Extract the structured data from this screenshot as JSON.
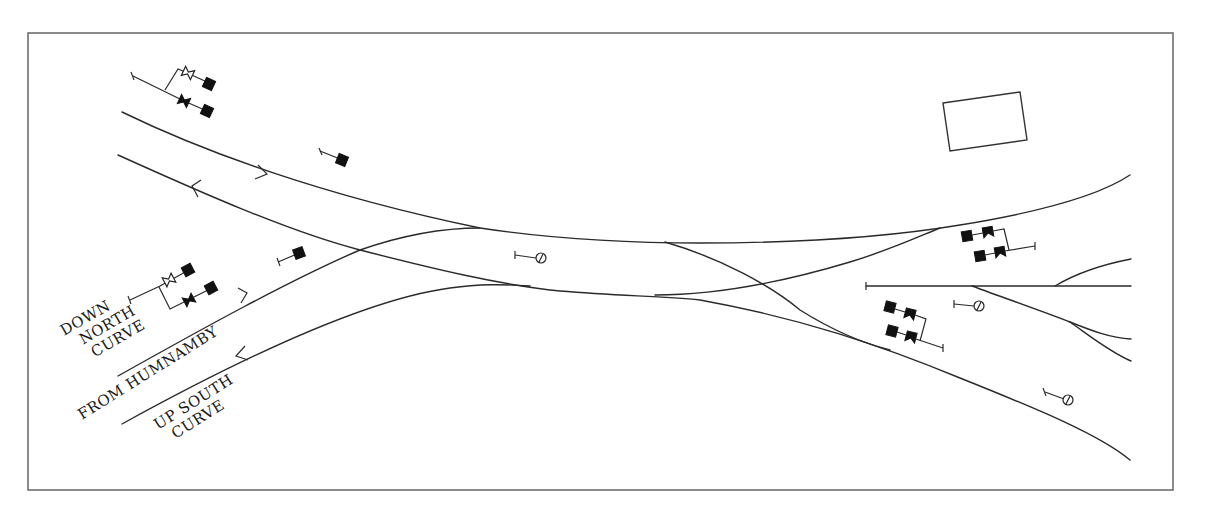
{
  "diagram": {
    "type": "railway-track-layout",
    "frame": {
      "x": 28,
      "y": 33,
      "width": 1145,
      "height": 457,
      "color": "#6e6e6e"
    },
    "labels": {
      "down_north_curve": [
        "DOWN",
        "NORTH",
        "CURVE"
      ],
      "from_humnamby": "FROM HUMNAMBY",
      "up_south_curve": [
        "UP SOUTH",
        "CURVE"
      ]
    },
    "tracks": [
      {
        "id": "down-main",
        "direction": "right"
      },
      {
        "id": "up-main",
        "direction": "left"
      },
      {
        "id": "from-humnamby",
        "direction": "right"
      },
      {
        "id": "up-south-curve",
        "direction": "left"
      },
      {
        "id": "crossover"
      },
      {
        "id": "siding"
      },
      {
        "id": "branch-lines"
      }
    ],
    "signals": {
      "gantry_top_left": {
        "type": "bracket",
        "heads": 3
      },
      "single_top": {
        "type": "stop"
      },
      "single_mid_left": {
        "type": "stop"
      },
      "gantry_mid_left": {
        "type": "bracket",
        "heads": 3
      },
      "disc_center": {
        "type": "ground-disc"
      },
      "gantry_right_top": {
        "type": "bracket",
        "heads": 4
      },
      "gantry_right_bottom": {
        "type": "bracket",
        "heads": 4
      },
      "disc_right": {
        "type": "ground-disc"
      },
      "disc_bottom_right": {
        "type": "ground-disc"
      }
    },
    "building": {
      "shape": "rectangle"
    },
    "colors": {
      "line": "#2a2a2a",
      "signal": "#111111",
      "background": "#ffffff"
    }
  }
}
